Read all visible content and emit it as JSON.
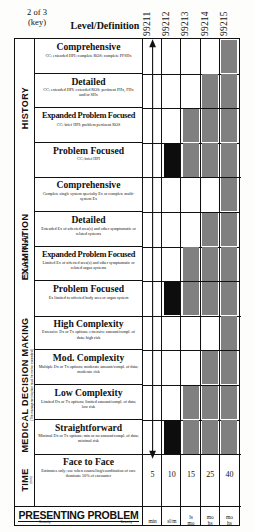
{
  "header": {
    "key_line1": "2 of 3",
    "key_line2": "(key)",
    "level_label": "Level/Definition",
    "codes": [
      "99211",
      "99212",
      "99213",
      "99214",
      "99215"
    ]
  },
  "annotations": {
    "nurse_visit": "\"Nurse Visit\""
  },
  "sections": [
    {
      "name": "HISTORY",
      "label": "HISTORY",
      "sublabel": "",
      "rows": [
        {
          "title": "Comprehensive",
          "sub": "CC; extended HPI; complete ROS; complete PFSHx",
          "shade": [
            "99215"
          ],
          "black": []
        },
        {
          "title": "Detailed",
          "sub": "CC; extended HPI; extended ROS; pertinent PHx, FHx and/or SHx",
          "shade": [
            "99214",
            "99215"
          ],
          "black": []
        },
        {
          "title": "Expanded Problem Focused",
          "sub": "CC; brief HPI; problem pertinent ROS",
          "shade": [
            "99213",
            "99214",
            "99215"
          ],
          "black": []
        },
        {
          "title": "Problem Focused",
          "sub": "CC; brief HPI",
          "shade": [
            "99213",
            "99214",
            "99215"
          ],
          "black": [
            "99212"
          ]
        }
      ]
    },
    {
      "name": "EXAMINATION",
      "label": "EXAMINATION",
      "sublabel": "",
      "rows": [
        {
          "title": "Comprehensive",
          "sub": "Complete single system specialty Ex or complete multi-system Ex",
          "shade": [
            "99215"
          ],
          "black": []
        },
        {
          "title": "Detailed",
          "sub": "Extended Ex of affected area(s) and other symptomatic or related systems",
          "shade": [
            "99214",
            "99215"
          ],
          "black": []
        },
        {
          "title": "Expanded Problem Focused",
          "sub": "Limited Ex of affected area(s) and other symptomatic or related organ systems",
          "shade": [
            "99213",
            "99214",
            "99215"
          ],
          "black": []
        },
        {
          "title": "Problem Focused",
          "sub": "Ex limited to affected body area or organ system",
          "shade": [
            "99213",
            "99214",
            "99215"
          ],
          "black": [
            "99212"
          ]
        }
      ]
    },
    {
      "name": "MEDICAL DECISION MAKING",
      "label": "MEDICAL DECISION MAKING",
      "sublabel": "(The management option must be met or exceeded)",
      "rows": [
        {
          "title": "High Complexity",
          "sub": "Extensive Dx or Tx options; extensive amount/compl. of data; high risk",
          "shade": [
            "99215"
          ],
          "black": []
        },
        {
          "title": "Mod. Complexity",
          "sub": "Multiple Dx or Tx options; moderate amount/compl. of data; moderate risk",
          "shade": [
            "99214",
            "99215"
          ],
          "black": []
        },
        {
          "title": "Low Complexity",
          "sub": "Limited Dx or Tx options; limited amount/compl. of data; low risk",
          "shade": [
            "99213",
            "99214",
            "99215"
          ],
          "black": []
        },
        {
          "title": "Straightforward",
          "sub": "Minimal Dx or Tx options; min or no amount/compl. of data; minimal risk",
          "shade": [
            "99213",
            "99214",
            "99215"
          ],
          "black": [
            "99212"
          ]
        }
      ]
    }
  ],
  "time": {
    "label": "TIME",
    "sublabel": "(min)",
    "title": "Face to Face",
    "sub": "Estimates only; use when counseling/coordination of care dominate 50% of encounter",
    "values": [
      "5",
      "10",
      "15",
      "25",
      "40"
    ]
  },
  "presenting_problem": {
    "title": "PRESENTING PROBLEM",
    "flank_left": "Severity",
    "flank_right": "Severity",
    "values": [
      {
        "line1": "min",
        "line2": ""
      },
      {
        "line1": "sl/m",
        "line2": ""
      },
      {
        "line1": "ls",
        "line2": "mo"
      },
      {
        "line1": "mo",
        "line2": "hs"
      },
      {
        "line1": "mo",
        "line2": "hs"
      }
    ]
  }
}
